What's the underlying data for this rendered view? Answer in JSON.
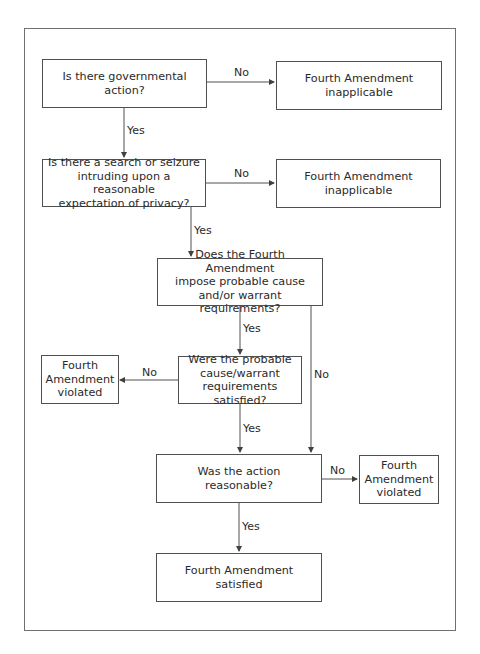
{
  "diagram": {
    "nodes": {
      "q_governmental": "Is there governmental\naction?",
      "r_inapplicable_1": "Fourth Amendment\ninapplicable",
      "q_search_seizure": "Is there a search or seizure\nintruding upon a reasonable\nexpectation of privacy?",
      "r_inapplicable_2": "Fourth Amendment\ninapplicable",
      "q_impose": "Does the Fourth Amendment\nimpose probable cause\nand/or warrant requirements?",
      "r_violated_1": "Fourth\nAmendment\nviolated",
      "q_satisfied": "Were the probable\ncause/warrant\nrequirements satisfied?",
      "q_reasonable": "Was the action\nreasonable?",
      "r_violated_2": "Fourth\nAmendment\nviolated",
      "r_satisfied": "Fourth Amendment\nsatisfied"
    },
    "edges": {
      "e1": "No",
      "e2": "Yes",
      "e3": "No",
      "e4": "Yes",
      "e5": "Yes",
      "e6": "No",
      "e7": "No",
      "e8": "Yes",
      "e9": "No",
      "e10": "Yes"
    },
    "colors": {
      "line": "#505050",
      "text": "#2a2a2a",
      "background": "#ffffff"
    }
  }
}
